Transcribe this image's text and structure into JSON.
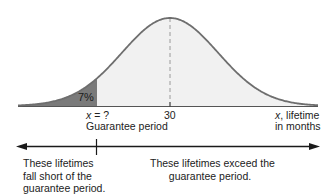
{
  "chart_data": {
    "type": "area",
    "title": "",
    "distribution": "normal",
    "mean": 30,
    "xlabel": "x, lifetime in months",
    "ylabel": "",
    "tick_labels": [
      "x = ?",
      "30"
    ],
    "shaded_tail": {
      "side": "left",
      "percent": 7,
      "label": "7%",
      "boundary_label": "x = ?",
      "boundary_caption": "Guarantee period"
    },
    "mean_line": {
      "x": 30,
      "style": "dashed"
    },
    "grid": false,
    "legend": null,
    "annotations": [
      "These lifetimes fall short of the guarantee period.",
      "These lifetimes exceed the guarantee period."
    ]
  },
  "colors": {
    "tail_fill": "#7a7a7a",
    "body_fill": "#f1f1f1",
    "curve_stroke": "#6e6e6e",
    "axis": "#444444",
    "arrow": "#1a1a1a",
    "text": "#222222"
  },
  "labels": {
    "tail_percent": "7%",
    "guarantee_x_var": "x",
    "guarantee_x_rest": " = ?",
    "guarantee_caption": "Guarantee period",
    "mean_tick": "30",
    "axis_var": "x",
    "axis_label_line1_rest": ", lifetime",
    "axis_label_line2": "in months",
    "left_note": [
      "These lifetimes",
      "fall short of the",
      "guarantee period."
    ],
    "right_note": [
      "These lifetimes exceed the",
      "guarantee period."
    ]
  }
}
